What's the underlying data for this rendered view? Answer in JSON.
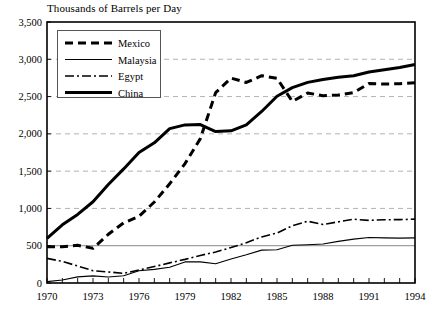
{
  "chart_data": {
    "type": "line",
    "title": "Thousands of Barrels per Day",
    "xlabel": "",
    "ylabel": "",
    "xlim": [
      1970,
      1994
    ],
    "ylim": [
      0,
      3500
    ],
    "yticks": [
      0,
      500,
      1000,
      1500,
      2000,
      2500,
      3000,
      3500
    ],
    "ytick_labels": [
      "0",
      "500",
      "1,000",
      "1,500",
      "2,000",
      "2,500",
      "3,000",
      "3,500"
    ],
    "xticks": [
      1970,
      1973,
      1976,
      1979,
      1982,
      1985,
      1988,
      1991,
      1994
    ],
    "xtick_labels": [
      "1970",
      "1973",
      "1976",
      "1979",
      "1982",
      "1985",
      "1988",
      "1991",
      "1994"
    ],
    "x": [
      1970,
      1971,
      1972,
      1973,
      1974,
      1975,
      1976,
      1977,
      1978,
      1979,
      1980,
      1981,
      1982,
      1983,
      1984,
      1985,
      1986,
      1987,
      1988,
      1989,
      1990,
      1991,
      1992,
      1993,
      1994
    ],
    "grid": true,
    "grid_axis": "y",
    "legend_position": "upper-left",
    "series": [
      {
        "name": "Mexico",
        "style": "dashed",
        "color": "#000000",
        "values": [
          487,
          486,
          506,
          465,
          653,
          806,
          894,
          1086,
          1330,
          1601,
          1936,
          2553,
          2748,
          2689,
          2780,
          2745,
          2435,
          2548,
          2512,
          2520,
          2553,
          2676,
          2668,
          2673,
          2685
        ]
      },
      {
        "name": "Malaysia",
        "style": "thin-solid",
        "color": "#000000",
        "values": [
          18,
          40,
          82,
          95,
          81,
          98,
          165,
          183,
          212,
          283,
          283,
          259,
          322,
          378,
          441,
          446,
          506,
          513,
          523,
          558,
          588,
          610,
          605,
          602,
          605
        ]
      },
      {
        "name": "Egypt",
        "style": "dash-dot",
        "color": "#000000",
        "values": [
          330,
          290,
          228,
          165,
          148,
          130,
          174,
          220,
          270,
          317,
          370,
          415,
          475,
          540,
          618,
          670,
          767,
          828,
          785,
          820,
          855,
          840,
          848,
          850,
          856
        ]
      },
      {
        "name": "China",
        "style": "thick-solid",
        "color": "#000000",
        "values": [
          600,
          780,
          920,
          1090,
          1320,
          1530,
          1750,
          1880,
          2070,
          2120,
          2125,
          2030,
          2040,
          2120,
          2300,
          2505,
          2620,
          2690,
          2730,
          2760,
          2780,
          2830,
          2860,
          2890,
          2930
        ]
      }
    ]
  },
  "legend": {
    "items": [
      {
        "label": "Mexico",
        "style": "dashed"
      },
      {
        "label": "Malaysia",
        "style": "thin-solid"
      },
      {
        "label": "Egypt",
        "style": "dash-dot"
      },
      {
        "label": "China",
        "style": "thick-solid"
      }
    ]
  }
}
